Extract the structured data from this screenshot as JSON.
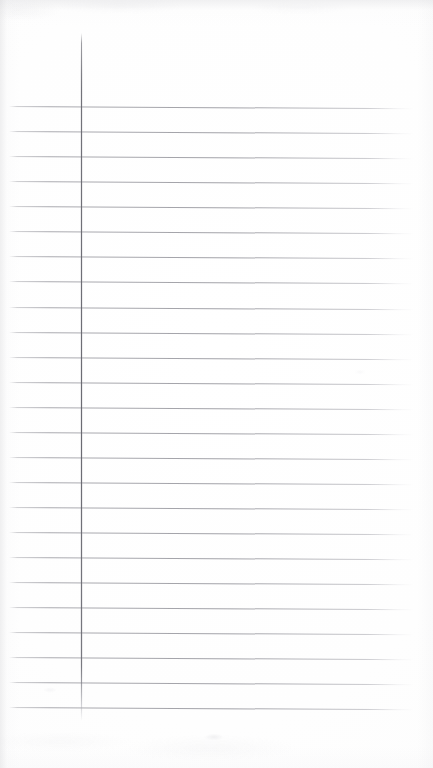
{
  "document": {
    "kind": "scanned-ruled-paper",
    "title": "Blank Ruled Notebook Page",
    "page_width": 433,
    "page_height": 768,
    "background_color": "#ffffff",
    "content_text": "",
    "has_handwriting": false,
    "has_printed_text": false
  },
  "ruling": {
    "horizontal_line_color": "#92929a",
    "horizontal_line_count": 25,
    "line_spacing_px": 25,
    "first_line_y": 106,
    "last_line_y": 707,
    "line_start_x": 9,
    "line_end_x": 414,
    "skew_degrees": 0.32,
    "lines_y": [
      106,
      131,
      156,
      181,
      206,
      231,
      256,
      281,
      307,
      332,
      357,
      382,
      407,
      432,
      457,
      482,
      507,
      532,
      557,
      582,
      607,
      632,
      657,
      682,
      707
    ]
  },
  "margin_rule": {
    "label": "vertical-margin-line",
    "color": "#64646c",
    "x": 81,
    "top_y": 33,
    "bottom_y": 721
  }
}
